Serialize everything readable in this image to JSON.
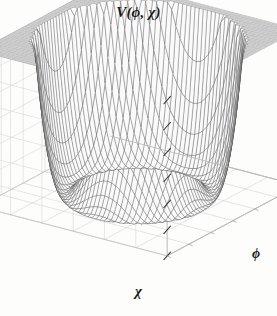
{
  "figure": {
    "title": "V(ϕ, χ)",
    "background_color": "#fdfdfc",
    "width": 277,
    "height": 316
  },
  "axes": {
    "x_label": "χ",
    "y_label": "ϕ",
    "z_label": "V(ϕ, χ)",
    "tick_count_vertical": 6,
    "grid": true,
    "box_frame": true,
    "frame_color": "#b9b9b9",
    "tick_color": "#3a3a3a"
  },
  "chart_data": {
    "type": "surface",
    "title": "V(ϕ, χ)",
    "xlabel": "χ",
    "ylabel": "ϕ",
    "zlabel": "V(ϕ, χ)",
    "function": "mexican-hat double-well potential",
    "formula": "V = lambda*(phi^2 + chi^2 - v^2)^2",
    "xlim": [
      -1.55,
      1.55
    ],
    "ylim": [
      -1.55,
      1.55
    ],
    "zlim": [
      0,
      1.0
    ],
    "z_clip": 1.0,
    "minimum_ring_radius": 1.0,
    "saddle_height_at_origin": 1.0,
    "grid_n_u": 46,
    "grid_n_v": 46,
    "mesh_color": "#4a4a4a",
    "face_color": "#fafafa",
    "plateau_shade": "#cfcfcf",
    "legend": "none",
    "gridlines": true,
    "annotations": []
  },
  "view": {
    "azimuth_deg": 35,
    "elevation_deg": 22,
    "projection": "parallel"
  }
}
